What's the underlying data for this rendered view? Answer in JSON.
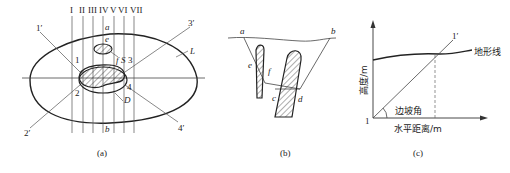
{
  "panel_a": {
    "caption": "(a)",
    "section_labels": [
      "I",
      "II",
      "III",
      "IV",
      "V",
      "VI",
      "VII"
    ],
    "labels": {
      "a": "a",
      "b": "b",
      "e": "e",
      "f": "f",
      "S": "S",
      "D": "D",
      "L": "L",
      "p1": "1",
      "p2": "2",
      "p3": "3",
      "p4": "4",
      "p1p": "1′",
      "p2p": "2′",
      "p3p": "3′",
      "p4p": "4′"
    }
  },
  "panel_b": {
    "caption": "(b)",
    "labels": {
      "a": "a",
      "b": "b",
      "c": "c",
      "d": "d",
      "e": "e",
      "f": "f"
    }
  },
  "panel_c": {
    "caption": "(c)",
    "y_axis_label": "高度/m",
    "x_axis_label": "水平距离/m",
    "terrain_label": "地形线",
    "angle_label": "边坡角",
    "origin_label": "1",
    "line_end_label": "1′"
  }
}
